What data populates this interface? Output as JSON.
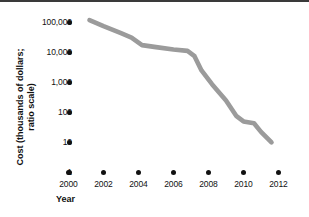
{
  "chart_data": {
    "type": "line",
    "title": "",
    "xlabel": "Year",
    "ylabel_line1": "Cost (thousands of dollars;",
    "ylabel_line2": "ratio scale)",
    "ylabel": "Cost (thousands of dollars; ratio scale)",
    "y_scale": "log",
    "y_tick_labels": [
      "100,000",
      "10,000",
      "1,000",
      "100",
      "10",
      "1"
    ],
    "y_tick_values": [
      100000,
      10000,
      1000,
      100,
      10,
      1
    ],
    "ylim": [
      1,
      100000
    ],
    "x_tick_labels": [
      "2000",
      "2002",
      "2004",
      "2006",
      "2008",
      "2010",
      "2012"
    ],
    "x_tick_values": [
      2000,
      2002,
      2004,
      2006,
      2008,
      2010,
      2012
    ],
    "xlim": [
      2000,
      2012
    ],
    "grid": false,
    "legend": false,
    "series": [
      {
        "name": "Cost",
        "color": "#9b9b9b",
        "x": [
          2001.2,
          2002.0,
          2003.0,
          2003.6,
          2004.2,
          2005.0,
          2006.0,
          2006.8,
          2007.2,
          2007.6,
          2008.2,
          2009.0,
          2009.6,
          2010.0,
          2010.6,
          2011.0,
          2011.6
        ],
        "y": [
          95000,
          60000,
          35000,
          25000,
          14000,
          12000,
          10000,
          9000,
          6000,
          2000,
          700,
          200,
          60,
          40,
          35,
          18,
          8
        ]
      }
    ]
  },
  "axis": {
    "x_title": "Year",
    "y_title_line1": "Cost (thousands of dollars;",
    "y_title_line2": "ratio scale)"
  },
  "colors": {
    "line": "#9b9b9b",
    "text": "#111111",
    "background": "#ffffff",
    "rule": "#3a3a3a"
  }
}
